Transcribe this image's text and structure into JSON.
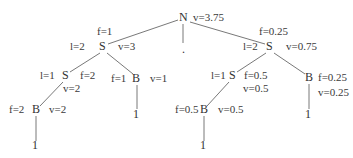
{
  "diagram": {
    "type": "tree",
    "nodes": [
      {
        "id": "root",
        "label": "N",
        "x": 183,
        "y": 18,
        "annotations": [
          {
            "text": "v=3.75",
            "x": 193,
            "y": 18
          }
        ]
      },
      {
        "id": "root_mid",
        "label": ".",
        "x": 186,
        "y": 50,
        "annotations": []
      },
      {
        "id": "s_left",
        "label": "S",
        "x": 103,
        "y": 47,
        "annotations": [
          {
            "text": "f=1",
            "x": 97,
            "y": 32
          },
          {
            "text": "l=2",
            "x": 70,
            "y": 47
          },
          {
            "text": "v=3",
            "x": 118,
            "y": 47
          }
        ]
      },
      {
        "id": "s_right",
        "label": "S",
        "x": 270,
        "y": 47,
        "annotations": [
          {
            "text": "f=0.25",
            "x": 259,
            "y": 32
          },
          {
            "text": "l=2",
            "x": 243,
            "y": 47
          },
          {
            "text": "v=0.75",
            "x": 286,
            "y": 47
          }
        ]
      },
      {
        "id": "s_ll",
        "label": "S",
        "x": 66,
        "y": 76,
        "annotations": [
          {
            "text": "l=1",
            "x": 40,
            "y": 76
          },
          {
            "text": "f=2",
            "x": 80,
            "y": 76
          },
          {
            "text": "v=2",
            "x": 63,
            "y": 89
          }
        ]
      },
      {
        "id": "b_lr",
        "label": "B",
        "x": 136,
        "y": 79,
        "annotations": [
          {
            "text": "f=1",
            "x": 111,
            "y": 79
          },
          {
            "text": "v=1",
            "x": 150,
            "y": 79
          }
        ]
      },
      {
        "id": "b_lll",
        "label": "B",
        "x": 36,
        "y": 110,
        "annotations": [
          {
            "text": "f=2",
            "x": 9,
            "y": 110
          },
          {
            "text": "v=2",
            "x": 49,
            "y": 110
          }
        ]
      },
      {
        "id": "s_rl",
        "label": "S",
        "x": 233,
        "y": 76,
        "annotations": [
          {
            "text": "l=1",
            "x": 211,
            "y": 76
          },
          {
            "text": "f=0.5",
            "x": 244,
            "y": 76
          },
          {
            "text": "v=0.5",
            "x": 243,
            "y": 89
          }
        ]
      },
      {
        "id": "b_rr",
        "label": "B",
        "x": 309,
        "y": 78,
        "annotations": [
          {
            "text": "f=0.25",
            "x": 318,
            "y": 78
          },
          {
            "text": "v=0.25",
            "x": 318,
            "y": 93
          }
        ]
      },
      {
        "id": "b_rll",
        "label": "B",
        "x": 204,
        "y": 110,
        "annotations": [
          {
            "text": "f=0.5",
            "x": 175,
            "y": 110
          },
          {
            "text": "v=0.5",
            "x": 218,
            "y": 110
          }
        ]
      },
      {
        "id": "leaf_lr",
        "label": "1",
        "x": 137,
        "y": 115,
        "annotations": []
      },
      {
        "id": "leaf_lll",
        "label": "1",
        "x": 36,
        "y": 146,
        "annotations": []
      },
      {
        "id": "leaf_rr",
        "label": "1",
        "x": 309,
        "y": 115,
        "annotations": []
      },
      {
        "id": "leaf_rll",
        "label": "1",
        "x": 204,
        "y": 146,
        "annotations": []
      }
    ],
    "edges": [
      {
        "from": [
          178,
          20
        ],
        "to": [
          108,
          44
        ]
      },
      {
        "from": [
          183,
          24
        ],
        "to": [
          183,
          43
        ]
      },
      {
        "from": [
          190,
          22
        ],
        "to": [
          265,
          44
        ]
      },
      {
        "from": [
          100,
          53
        ],
        "to": [
          70,
          72
        ]
      },
      {
        "from": [
          107,
          53
        ],
        "to": [
          133,
          74
        ]
      },
      {
        "from": [
          63,
          82
        ],
        "to": [
          40,
          106
        ]
      },
      {
        "from": [
          137,
          85
        ],
        "to": [
          137,
          109
        ]
      },
      {
        "from": [
          36,
          116
        ],
        "to": [
          36,
          141
        ]
      },
      {
        "from": [
          266,
          53
        ],
        "to": [
          237,
          72
        ]
      },
      {
        "from": [
          274,
          53
        ],
        "to": [
          305,
          74
        ]
      },
      {
        "from": [
          309,
          84
        ],
        "to": [
          309,
          109
        ]
      },
      {
        "from": [
          229,
          82
        ],
        "to": [
          207,
          106
        ]
      },
      {
        "from": [
          204,
          116
        ],
        "to": [
          204,
          141
        ]
      }
    ]
  }
}
